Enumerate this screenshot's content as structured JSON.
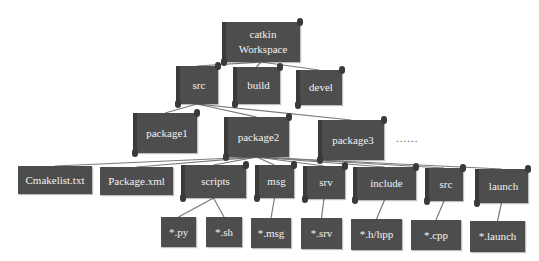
{
  "colors": {
    "node": "#4d4d4d",
    "node_text": "#f2f2f2",
    "line": "#7a7a7a",
    "background": "#ffffff"
  },
  "nodes": [
    {
      "id": "root",
      "label": "catkin\nWorkspace",
      "x": 222,
      "y": 22,
      "w": 78,
      "h": 40,
      "shape": "scroll"
    },
    {
      "id": "src",
      "label": "src",
      "x": 176,
      "y": 66,
      "w": 42,
      "h": 38,
      "shape": "scroll"
    },
    {
      "id": "build",
      "label": "build",
      "x": 233,
      "y": 67,
      "w": 47,
      "h": 37,
      "shape": "scroll"
    },
    {
      "id": "devel",
      "label": "devel",
      "x": 296,
      "y": 70,
      "w": 46,
      "h": 35,
      "shape": "scroll"
    },
    {
      "id": "package1",
      "label": "package1",
      "x": 133,
      "y": 113,
      "w": 64,
      "h": 40,
      "shape": "scroll"
    },
    {
      "id": "package2",
      "label": "package2",
      "x": 224,
      "y": 117,
      "w": 65,
      "h": 40,
      "shape": "scroll"
    },
    {
      "id": "package3",
      "label": "package3",
      "x": 318,
      "y": 120,
      "w": 66,
      "h": 40,
      "shape": "scroll"
    },
    {
      "id": "cmakelist",
      "label": "Cmakelist.txt",
      "x": 18,
      "y": 166,
      "w": 74,
      "h": 28,
      "shape": "rect"
    },
    {
      "id": "packagexml",
      "label": "Package.xml",
      "x": 100,
      "y": 167,
      "w": 73,
      "h": 28,
      "shape": "rect"
    },
    {
      "id": "scripts",
      "label": "scripts",
      "x": 181,
      "y": 165,
      "w": 65,
      "h": 33,
      "shape": "scroll"
    },
    {
      "id": "msg",
      "label": "msg",
      "x": 255,
      "y": 165,
      "w": 39,
      "h": 33,
      "shape": "scroll"
    },
    {
      "id": "srv",
      "label": "srv",
      "x": 303,
      "y": 166,
      "w": 42,
      "h": 33,
      "shape": "scroll"
    },
    {
      "id": "include",
      "label": "include",
      "x": 353,
      "y": 167,
      "w": 63,
      "h": 33,
      "shape": "scroll"
    },
    {
      "id": "src2",
      "label": "src",
      "x": 425,
      "y": 168,
      "w": 38,
      "h": 33,
      "shape": "scroll"
    },
    {
      "id": "launch",
      "label": "launch",
      "x": 475,
      "y": 169,
      "w": 53,
      "h": 34,
      "shape": "scroll"
    },
    {
      "id": "py",
      "label": "*.py",
      "x": 161,
      "y": 217,
      "w": 35,
      "h": 30,
      "shape": "rect"
    },
    {
      "id": "sh",
      "label": "*.sh",
      "x": 206,
      "y": 217,
      "w": 36,
      "h": 30,
      "shape": "rect"
    },
    {
      "id": "msgf",
      "label": "*.msg",
      "x": 251,
      "y": 218,
      "w": 40,
      "h": 30,
      "shape": "rect"
    },
    {
      "id": "srvf",
      "label": "*.srv",
      "x": 301,
      "y": 218,
      "w": 41,
      "h": 31,
      "shape": "rect"
    },
    {
      "id": "hpp",
      "label": "*.h/hpp",
      "x": 351,
      "y": 219,
      "w": 51,
      "h": 31,
      "shape": "rect"
    },
    {
      "id": "cpp",
      "label": "*.cpp",
      "x": 411,
      "y": 220,
      "w": 50,
      "h": 30,
      "shape": "rect"
    },
    {
      "id": "launchf",
      "label": "*.launch",
      "x": 470,
      "y": 221,
      "w": 55,
      "h": 31,
      "shape": "rect"
    }
  ],
  "edges": [
    [
      "root",
      "src"
    ],
    [
      "root",
      "build"
    ],
    [
      "root",
      "devel"
    ],
    [
      "src",
      "package1"
    ],
    [
      "src",
      "package2"
    ],
    [
      "src",
      "package3"
    ],
    [
      "package2",
      "cmakelist"
    ],
    [
      "package2",
      "packagexml"
    ],
    [
      "package2",
      "scripts"
    ],
    [
      "package2",
      "msg"
    ],
    [
      "package2",
      "srv"
    ],
    [
      "package2",
      "include"
    ],
    [
      "package2",
      "src2"
    ],
    [
      "package2",
      "launch"
    ],
    [
      "scripts",
      "py"
    ],
    [
      "scripts",
      "sh"
    ],
    [
      "msg",
      "msgf"
    ],
    [
      "srv",
      "srvf"
    ],
    [
      "include",
      "hpp"
    ],
    [
      "src2",
      "cpp"
    ],
    [
      "launch",
      "launchf"
    ]
  ],
  "ellipsis": {
    "label": "......",
    "x": 396,
    "y": 132
  }
}
